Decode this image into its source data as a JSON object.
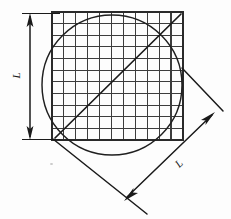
{
  "figure": {
    "type": "geometry-diagram",
    "canvas": {
      "width": 231,
      "height": 219,
      "background": "#fdfdfd"
    },
    "ink_color": "#1a1a1a",
    "grid_line_color": "#3d3d3d",
    "labels": {
      "vertical_side": "L",
      "diagonal_side": "L"
    },
    "square": {
      "name": "grid-square",
      "x": 52,
      "y": 12,
      "width": 131,
      "height": 128,
      "columns": 11,
      "rows": 11,
      "stroke_width_outer": 1.8,
      "stroke_width_inner": 1.1
    },
    "circle": {
      "name": "inscribed-circle",
      "cx": 112,
      "cy": 85,
      "r": 70,
      "stroke_width": 1.5
    },
    "diagonal": {
      "name": "square-diagonal",
      "x1": 55,
      "y1": 138,
      "x2": 181,
      "y2": 14,
      "stroke_width": 1.6
    },
    "vertical_dimension": {
      "name": "vertical-dimension-L",
      "line_x": 30,
      "y_top": 14,
      "y_bottom": 139,
      "extension_top": {
        "x1": 24,
        "y1": 14,
        "x2": 60,
        "y2": 14
      },
      "extension_bottom": {
        "x1": 24,
        "y1": 139,
        "x2": 60,
        "y2": 139
      },
      "arrow_size": 8,
      "stroke_width": 1.4
    },
    "diagonal_dimension": {
      "name": "diagonal-dimension-L",
      "x1": 130,
      "y1": 200,
      "x2": 209,
      "y2": 118,
      "extension_lower": {
        "x1": 53,
        "y1": 139,
        "x2": 146,
        "y2": 213
      },
      "extension_upper": {
        "x1": 182,
        "y1": 69,
        "x2": 222,
        "y2": 110
      },
      "arrow_size": 9,
      "stroke_width": 1.5
    }
  }
}
